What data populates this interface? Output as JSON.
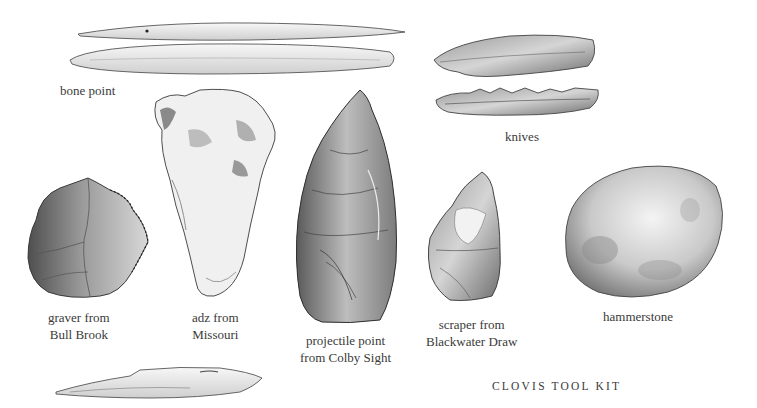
{
  "plate": {
    "title": "CLOVIS TOOL KIT",
    "ink_color": "#3a3a3a",
    "background": "#ffffff"
  },
  "tools": [
    {
      "id": "bone-point",
      "lines": [
        "bone point"
      ]
    },
    {
      "id": "knives",
      "lines": [
        "knives"
      ]
    },
    {
      "id": "graver",
      "lines": [
        "graver from",
        "Bull Brook"
      ]
    },
    {
      "id": "adz",
      "lines": [
        "adz from",
        "Missouri"
      ]
    },
    {
      "id": "projectile-point",
      "lines": [
        "projectile point",
        "from Colby Sight"
      ]
    },
    {
      "id": "scraper",
      "lines": [
        "scraper from",
        "Blackwater Draw"
      ]
    },
    {
      "id": "hammerstone",
      "lines": [
        "hammerstone"
      ]
    },
    {
      "id": "bone-tool-bottom",
      "lines": []
    }
  ]
}
